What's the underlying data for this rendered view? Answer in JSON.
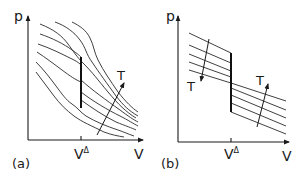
{
  "figure": {
    "panels": [
      {
        "id": "a",
        "label": "(a)",
        "y_axis_label": "p",
        "x_axis_label": "V",
        "x_tick_label": "V",
        "x_tick_superscript": "Δ",
        "arrow_label": "T",
        "description": "Family of isotherms p(V) with a vertical jump at V^Δ; temperature T increases along the arrow"
      },
      {
        "id": "b",
        "label": "(b)",
        "y_axis_label": "p",
        "x_axis_label": "V",
        "x_tick_label": "V",
        "x_tick_superscript": "Δ",
        "arrow_label_left": "T",
        "arrow_label_right": "T",
        "description": "Straight-line isotherms crossing at a common point on V^Δ; T increases downward on the left and upward on the right"
      }
    ],
    "colors": {
      "ink": "#1a1a1a",
      "background": "#ffffff"
    }
  }
}
